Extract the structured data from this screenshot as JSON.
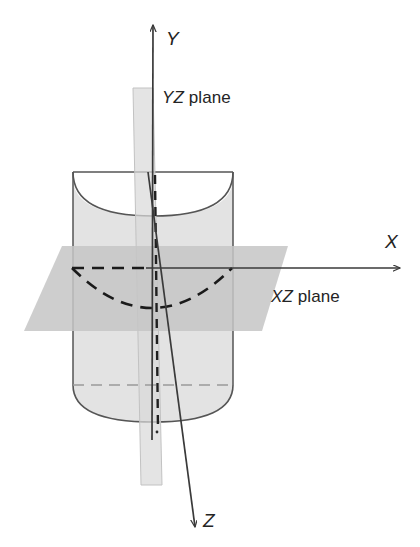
{
  "figure": {
    "background_color": "#ffffff",
    "stroke_color": "#3a3a3a",
    "axes": [
      {
        "id": "y",
        "label": "Y",
        "italic": true,
        "direction": "up",
        "tail": [
          152,
          455
        ],
        "head": [
          153,
          22
        ]
      },
      {
        "id": "x",
        "label": "X",
        "italic": true,
        "direction": "right",
        "tail": [
          60,
          268
        ],
        "head": [
          402,
          268
        ]
      },
      {
        "id": "z",
        "label": "Z",
        "italic": true,
        "direction": "down-right",
        "tail": [
          148,
          172
        ],
        "head": [
          196,
          531
        ]
      }
    ],
    "planes": [
      {
        "id": "yz-plane",
        "label_prefix": "YZ",
        "label_suffix": " plane",
        "fill": "#d9d9d9",
        "opacity": 0.72,
        "points": "133,88 153,88 162,485 141,485"
      },
      {
        "id": "xz-plane",
        "label_prefix": "XZ",
        "label_suffix": " plane",
        "fill": "#c6c6c6",
        "opacity": 0.85,
        "points": "62,246 288,246 262,331 24,331"
      }
    ],
    "cylinder": {
      "id": "cylinder",
      "fill": "#e3e3e3",
      "stroke": "#555555",
      "left": 73,
      "right": 233,
      "top": 172,
      "bottom_rim": 385,
      "bottom_front": 422,
      "top_front_dip": 216,
      "axis_dashed": true,
      "axis_x": 156
    },
    "cross_section_curve": {
      "id": "parabola-cross-section",
      "style": "dashed",
      "color": "#1a1a1a",
      "description": "dashed parabolic cross-section of the cylinder in the XZ plane",
      "left_end": [
        72,
        268
      ],
      "vertex": [
        152,
        307
      ],
      "right_end": [
        232,
        268
      ]
    },
    "hidden_lines": {
      "style": "dashed",
      "color": "#7a7a7a",
      "bottom_rim_y": 385
    }
  },
  "labels": {
    "y_axis": "Y",
    "x_axis": "X",
    "z_axis": "Z",
    "yz_plane_italic": "YZ",
    "yz_plane_rest": " plane",
    "xz_plane_italic": "XZ",
    "xz_plane_rest": " plane"
  },
  "colors": {
    "stroke": "#3a3a3a",
    "cylinder_fill": "#e3e3e3",
    "cylinder_stroke": "#555555",
    "yz_plane_fill": "#d9d9d9",
    "xz_plane_fill": "#c6c6c6",
    "dash_dark": "#1a1a1a",
    "dash_light": "#8a8a8a",
    "text": "#242424",
    "background": "#ffffff"
  }
}
